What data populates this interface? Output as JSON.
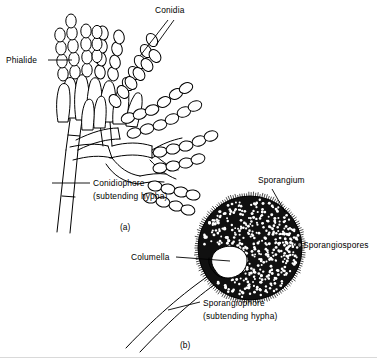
{
  "figure": {
    "background_color": "#ffffff",
    "ink_color": "#000000",
    "width": 377,
    "height": 359
  },
  "panels": [
    {
      "id": "a",
      "caption": "(a)",
      "subject": "conidiophore with phialides and conidia",
      "labels": [
        {
          "key": "phialide",
          "text": "Phialide",
          "text_x": 6,
          "text_y": 63,
          "anchor": "start"
        },
        {
          "key": "conidia",
          "text": "Conidia",
          "text_x": 155,
          "text_y": 13,
          "anchor": "start"
        },
        {
          "key": "conidiophore_line1",
          "text": "Conidiophore",
          "text_x": 93,
          "text_y": 186,
          "anchor": "start"
        },
        {
          "key": "conidiophore_line2",
          "text": "(subtending hypha)",
          "text_x": 93,
          "text_y": 199,
          "anchor": "start"
        }
      ]
    },
    {
      "id": "b",
      "caption": "(b)",
      "subject": "sporangium with columella and sporangiospores",
      "labels": [
        {
          "key": "sporangium",
          "text": "Sporangium",
          "text_x": 258,
          "text_y": 183,
          "anchor": "start"
        },
        {
          "key": "sporangiospores",
          "text": "Sporangiospores",
          "text_x": 303,
          "text_y": 248,
          "anchor": "start"
        },
        {
          "key": "columella",
          "text": "Columella",
          "text_x": 131,
          "text_y": 260,
          "anchor": "start"
        },
        {
          "key": "sporangiophore_line1",
          "text": "Sporangiophore",
          "text_x": 203,
          "text_y": 306,
          "anchor": "start"
        },
        {
          "key": "sporangiophore_line2",
          "text": "(subtending hypha)",
          "text_x": 203,
          "text_y": 319,
          "anchor": "start"
        }
      ]
    }
  ],
  "captions": {
    "panel_a": "(a)",
    "panel_a_x": 120,
    "panel_a_y": 230,
    "panel_b": "(b)",
    "panel_b_x": 180,
    "panel_b_y": 348
  },
  "structures": {
    "conidiophore": {
      "name": "conidiophore-stalk",
      "description": "thick subtending hypha rising from lower left with a septum"
    },
    "phialides": {
      "name": "phialide-cluster",
      "count": 9,
      "description": "flask-shaped cells radiating from the vesicle apex"
    },
    "conidia_chains": {
      "name": "conidia-chains",
      "count": 14,
      "description": "chains of ovoid conidia budding from phialide tips"
    },
    "sporangium": {
      "name": "sporangium-sphere",
      "center_x": 250,
      "center_y": 248,
      "radius": 52,
      "fill": "#101010",
      "description": "dark spherical sac packed with pale sporangiospores"
    },
    "columella": {
      "name": "columella-region",
      "center_x": 219,
      "center_y": 263,
      "description": "white swollen tip of the sporangiophore inside the sporangium"
    },
    "sporangiospores": {
      "name": "sporangiospore-dots",
      "approx_count": 430,
      "fill": "#ffffff"
    },
    "sporangiophore": {
      "name": "sporangiophore-stalk",
      "description": "curved two-line stalk descending to lower left"
    }
  }
}
